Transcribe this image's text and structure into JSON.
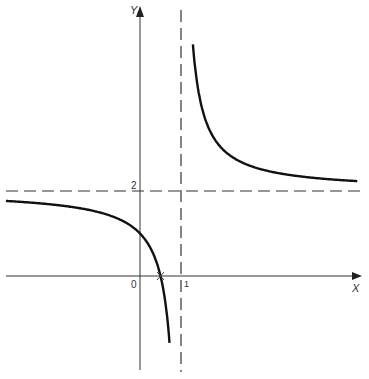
{
  "chart_data": {
    "type": "line",
    "title": "",
    "function": "y = (2x - 1) / (x - 1)",
    "xlabel": "X",
    "ylabel": "Y",
    "origin_label": "0",
    "x_tick_labels": [
      "1"
    ],
    "y_tick_labels": [
      "2"
    ],
    "asymptotes": {
      "vertical": 1,
      "horizontal": 2
    },
    "x_intercept": 0.5,
    "y_intercept": 1,
    "xlim": [
      -3.3,
      5.3
    ],
    "ylim": [
      -2.2,
      6.4
    ],
    "grid": false,
    "legend": null,
    "series": [
      {
        "name": "left branch",
        "x": [
          -3.3,
          -2,
          -1,
          -0.5,
          0,
          0.25,
          0.5,
          0.65,
          0.75
        ],
        "values": [
          1.77,
          1.67,
          1.5,
          1.33,
          1.0,
          0.67,
          0.0,
          -0.86,
          -2.0
        ]
      },
      {
        "name": "right branch",
        "x": [
          1.3,
          1.5,
          2,
          3,
          4,
          5.3
        ],
        "values": [
          5.33,
          4.0,
          3.0,
          2.5,
          2.33,
          2.23
        ]
      }
    ]
  },
  "labels": {
    "x_axis": "X",
    "y_axis": "Y",
    "origin": "0",
    "x_tick": "1",
    "y_tick": "2"
  }
}
